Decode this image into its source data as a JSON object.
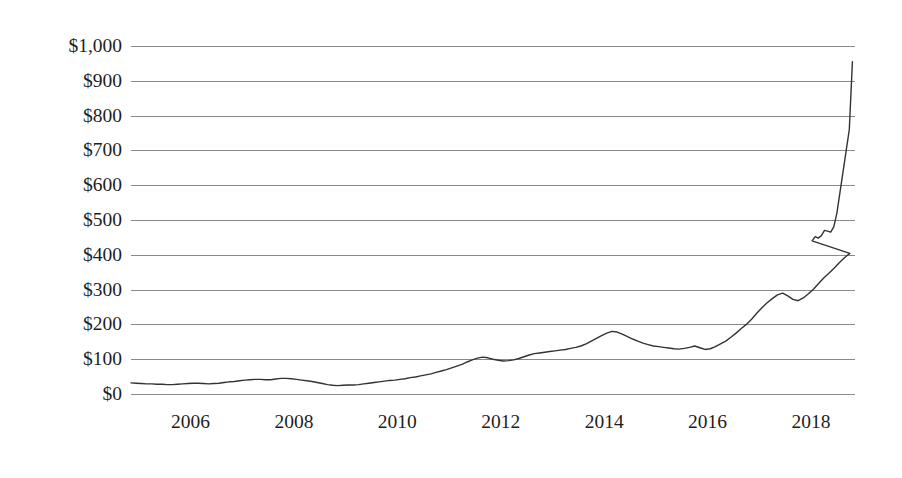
{
  "chart_data": {
    "type": "line",
    "title": "",
    "subtitle": "",
    "xlabel": "",
    "ylabel": "",
    "legend": [],
    "legend_position": "none",
    "grid": {
      "horizontal": true,
      "vertical": false,
      "color": "#8a8a8a"
    },
    "line_color": "#333333",
    "line_width": 1.4,
    "xlim": [
      2004.85,
      2018.85
    ],
    "ylim": [
      0,
      1000
    ],
    "y_ticks": [
      0,
      100,
      200,
      300,
      400,
      500,
      600,
      700,
      800,
      900,
      1000
    ],
    "y_tick_labels": [
      "$0",
      "$100",
      "$200",
      "$300",
      "$400",
      "$500",
      "$600",
      "$700",
      "$800",
      "$900",
      "$1,000"
    ],
    "x_ticks": [
      2006,
      2008,
      2010,
      2012,
      2014,
      2016,
      2018
    ],
    "x_tick_labels": [
      "2006",
      "2008",
      "2010",
      "2012",
      "2014",
      "2016",
      "2018"
    ],
    "series": [
      {
        "name": "price",
        "x": [
          2004.85,
          2004.95,
          2005.05,
          2005.15,
          2005.25,
          2005.35,
          2005.45,
          2005.55,
          2005.65,
          2005.75,
          2005.85,
          2005.95,
          2006.05,
          2006.15,
          2006.25,
          2006.35,
          2006.45,
          2006.55,
          2006.65,
          2006.75,
          2006.85,
          2006.95,
          2007.05,
          2007.15,
          2007.25,
          2007.35,
          2007.45,
          2007.55,
          2007.65,
          2007.75,
          2007.85,
          2007.95,
          2008.05,
          2008.15,
          2008.25,
          2008.35,
          2008.45,
          2008.55,
          2008.65,
          2008.75,
          2008.85,
          2008.95,
          2009.05,
          2009.15,
          2009.25,
          2009.35,
          2009.45,
          2009.55,
          2009.65,
          2009.75,
          2009.85,
          2009.95,
          2010.05,
          2010.15,
          2010.25,
          2010.35,
          2010.45,
          2010.55,
          2010.65,
          2010.75,
          2010.85,
          2010.95,
          2011.05,
          2011.15,
          2011.25,
          2011.35,
          2011.45,
          2011.55,
          2011.65,
          2011.75,
          2011.85,
          2011.95,
          2012.05,
          2012.15,
          2012.25,
          2012.35,
          2012.45,
          2012.55,
          2012.65,
          2012.75,
          2012.85,
          2012.95,
          2013.05,
          2013.15,
          2013.25,
          2013.35,
          2013.45,
          2013.55,
          2013.65,
          2013.75,
          2013.85,
          2013.95,
          2014.05,
          2014.15,
          2014.25,
          2014.35,
          2014.45,
          2014.55,
          2014.65,
          2014.75,
          2014.85,
          2014.95,
          2015.05,
          2015.15,
          2015.25,
          2015.35,
          2015.45,
          2015.55,
          2015.65,
          2015.75,
          2015.85,
          2015.95,
          2016.05,
          2016.15,
          2016.25,
          2016.35,
          2016.45,
          2016.55,
          2016.65,
          2016.75,
          2016.85,
          2016.95,
          2017.05,
          2017.15,
          2017.25,
          2017.35,
          2017.45,
          2017.55,
          2017.65,
          2017.75,
          2017.85,
          2017.95,
          2018.05,
          2018.15,
          2018.25,
          2018.35,
          2018.45,
          2018.55,
          2018.65,
          2018.75
        ],
        "y": [
          32,
          31,
          30,
          29,
          29,
          28,
          28,
          27,
          27,
          28,
          29,
          30,
          31,
          31,
          30,
          29,
          30,
          31,
          33,
          35,
          36,
          38,
          40,
          41,
          42,
          42,
          41,
          41,
          43,
          45,
          45,
          44,
          42,
          40,
          38,
          36,
          33,
          30,
          27,
          25,
          24,
          25,
          26,
          26,
          27,
          29,
          31,
          33,
          35,
          37,
          39,
          40,
          42,
          44,
          47,
          49,
          52,
          55,
          58,
          62,
          66,
          70,
          75,
          80,
          85,
          92,
          98,
          103,
          106,
          104,
          100,
          97,
          95,
          96,
          98,
          102,
          107,
          112,
          116,
          118,
          120,
          122,
          124,
          126,
          128,
          131,
          134,
          138,
          144,
          152,
          160,
          168,
          175,
          180,
          178,
          172,
          165,
          158,
          152,
          146,
          142,
          138,
          136,
          134,
          132,
          130,
          129,
          131,
          134,
          138,
          133,
          128,
          130,
          136,
          144,
          152,
          163,
          175,
          188,
          200,
          215,
          232,
          248,
          262,
          274,
          285,
          290,
          282,
          272,
          268,
          276,
          288,
          302,
          318,
          334,
          348,
          362,
          378,
          392,
          404
        ]
      }
    ],
    "series_tail": {
      "name": "price-continued",
      "x": [
        2017.95,
        2018.02,
        2018.08,
        2018.14,
        2018.2,
        2018.26,
        2018.32,
        2018.38,
        2018.44,
        2018.5,
        2018.56,
        2018.62,
        2018.68,
        2018.74,
        2018.8
      ],
      "y": [
        404,
        440,
        452,
        448,
        455,
        470,
        468,
        465,
        480,
        520,
        580,
        640,
        700,
        760,
        955
      ]
    },
    "annotations": []
  },
  "axis": {
    "y_title": "",
    "x_title": ""
  }
}
